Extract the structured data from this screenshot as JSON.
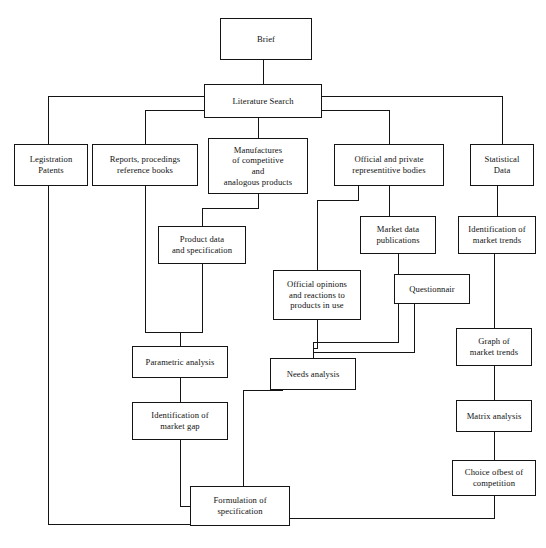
{
  "diagram": {
    "type": "flowchart",
    "orientation": "top-down",
    "line_color": "#141414",
    "box_fill": "#ffffff",
    "canvas": {
      "width": 546,
      "height": 548
    }
  },
  "nodes": [
    {
      "id": "brief",
      "label": "Brief",
      "x": 220,
      "y": 18,
      "w": 92,
      "h": 42
    },
    {
      "id": "literature_search",
      "label": "Literature Search",
      "x": 204,
      "y": 84,
      "w": 118,
      "h": 34
    },
    {
      "id": "legistration",
      "label": "Legistration\nPatents",
      "x": 14,
      "y": 144,
      "w": 74,
      "h": 42
    },
    {
      "id": "reports",
      "label": "Reports, procedings\nreference books",
      "x": 92,
      "y": 144,
      "w": 106,
      "h": 42
    },
    {
      "id": "manufactures",
      "label": "Manufactures\nof competitive\nand\nanalogous products",
      "x": 208,
      "y": 138,
      "w": 100,
      "h": 56
    },
    {
      "id": "official_bodies",
      "label": "Official and private\nrepresentitive bodies",
      "x": 334,
      "y": 144,
      "w": 110,
      "h": 42
    },
    {
      "id": "statistical_data",
      "label": "Statistical\nData",
      "x": 470,
      "y": 144,
      "w": 64,
      "h": 42
    },
    {
      "id": "product_data",
      "label": "Product data\nand specification",
      "x": 158,
      "y": 226,
      "w": 88,
      "h": 38
    },
    {
      "id": "market_data",
      "label": "Market data\npublications",
      "x": 360,
      "y": 216,
      "w": 76,
      "h": 38
    },
    {
      "id": "ident_trends",
      "label": "Identification of\nmarket trends",
      "x": 458,
      "y": 216,
      "w": 78,
      "h": 38
    },
    {
      "id": "official_opinions",
      "label": "Official opinions\nand reactions to\nproducts in use",
      "x": 273,
      "y": 270,
      "w": 88,
      "h": 50
    },
    {
      "id": "questionnair",
      "label": "Questionnair",
      "x": 394,
      "y": 274,
      "w": 76,
      "h": 30
    },
    {
      "id": "graph_trends",
      "label": "Graph of\nmarket trends",
      "x": 456,
      "y": 328,
      "w": 76,
      "h": 38
    },
    {
      "id": "parametric",
      "label": "Parametric analysis",
      "x": 132,
      "y": 346,
      "w": 96,
      "h": 32
    },
    {
      "id": "needs_analysis",
      "label": "Needs analysis",
      "x": 270,
      "y": 358,
      "w": 86,
      "h": 32
    },
    {
      "id": "ident_gap",
      "label": "Identification of\nmarket gap",
      "x": 132,
      "y": 402,
      "w": 96,
      "h": 38
    },
    {
      "id": "matrix",
      "label": "Matrix analysis",
      "x": 456,
      "y": 400,
      "w": 76,
      "h": 32
    },
    {
      "id": "choice_best",
      "label": "Choice ofbest of\ncompetition",
      "x": 452,
      "y": 460,
      "w": 84,
      "h": 36
    },
    {
      "id": "formulation",
      "label": "Formulation of\nspecification",
      "x": 190,
      "y": 486,
      "w": 100,
      "h": 40
    }
  ],
  "edges": [
    {
      "id": "brief-to-literature",
      "from": "brief",
      "to": "literature_search",
      "path": "M263,60 L263,84"
    },
    {
      "id": "literature-to-legistration",
      "from": "literature_search",
      "to": "legistration",
      "path": "M204,96 L48,96 L48,144"
    },
    {
      "id": "literature-to-reports",
      "from": "literature_search",
      "to": "reports",
      "path": "M204,110 L145,110 L145,144"
    },
    {
      "id": "literature-to-manufactures",
      "from": "literature_search",
      "to": "manufactures",
      "path": "M258,118 L258,138"
    },
    {
      "id": "literature-to-bodies",
      "from": "literature_search",
      "to": "official_bodies",
      "path": "M322,110 L389,110 L389,144"
    },
    {
      "id": "literature-to-statistical",
      "from": "literature_search",
      "to": "statistical_data",
      "path": "M322,96 L502,96 L502,144"
    },
    {
      "id": "manufactures-to-product",
      "from": "manufactures",
      "to": "product_data",
      "path": "M258,194 L258,208 L202,208 L202,226"
    },
    {
      "id": "bodies-to-market-data",
      "from": "official_bodies",
      "to": "market_data",
      "path": "M389,186 L389,216"
    },
    {
      "id": "bodies-to-opinions",
      "from": "official_bodies",
      "to": "official_opinions",
      "path": "M358,186 L358,200 L317,200 L317,270"
    },
    {
      "id": "statistical-to-ident",
      "from": "statistical_data",
      "to": "ident_trends",
      "path": "M497,186 L497,216"
    },
    {
      "id": "reports-to-product",
      "from": "reports",
      "to": "product_data",
      "path": "M145,186 L145,332 L202,332 L202,264"
    },
    {
      "id": "product-to-parametric",
      "from": "product_data",
      "to": "parametric",
      "path": "M202,264 L202,332 L180,332 L180,346"
    },
    {
      "id": "opinions-to-needs",
      "from": "official_opinions",
      "to": "needs_analysis",
      "path": "M317,320 L317,348 L313,348 L313,358"
    },
    {
      "id": "market-data-to-needs",
      "from": "market_data",
      "to": "needs_analysis",
      "path": "M398,254 L398,342 L313,342 L313,358"
    },
    {
      "id": "questionnair-to-needs",
      "from": "questionnair",
      "to": "needs_analysis",
      "path": "M414,304 L414,352 L313,352 L313,358"
    },
    {
      "id": "ident-trends-to-graph",
      "from": "ident_trends",
      "to": "graph_trends",
      "path": "M494,254 L494,328"
    },
    {
      "id": "parametric-to-gap",
      "from": "parametric",
      "to": "ident_gap",
      "path": "M180,378 L180,402"
    },
    {
      "id": "graph-to-matrix",
      "from": "graph_trends",
      "to": "matrix",
      "path": "M494,366 L494,400"
    },
    {
      "id": "matrix-to-choice",
      "from": "matrix",
      "to": "choice_best",
      "path": "M494,432 L494,460"
    },
    {
      "id": "gap-to-formulation",
      "from": "ident_gap",
      "to": "formulation",
      "path": "M180,440 L180,506 L190,506"
    },
    {
      "id": "needs-to-formulation",
      "from": "needs_analysis",
      "to": "formulation",
      "path": "M283,390 L243,390 L243,500 L190,500"
    },
    {
      "id": "legistration-to-formulation",
      "from": "legistration",
      "to": "formulation",
      "path": "M48,186 L48,524 L190,524"
    },
    {
      "id": "choice-to-formulation",
      "from": "choice_best",
      "to": "formulation",
      "path": "M494,496 L494,518 L290,518"
    }
  ]
}
